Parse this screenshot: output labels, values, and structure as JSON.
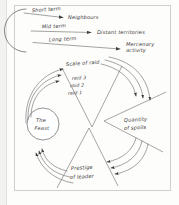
{
  "figure": {
    "title_visible": false,
    "background_color": "#fdfdfc",
    "ink_color": "#4a4a4a",
    "frame_color": "#cfcfcb"
  },
  "top_section": {
    "source_shape": "semicircle",
    "flows": [
      {
        "id": "short",
        "timescale": "Short term",
        "target": "Neighbours"
      },
      {
        "id": "mid",
        "timescale": "Mid term",
        "target": "Distant territories"
      },
      {
        "id": "long",
        "timescale": "Long term",
        "target_line1": "Mercenary",
        "target_line2": "activity"
      }
    ]
  },
  "cycle_section": {
    "center_node": {
      "line1": "The",
      "line2": "Feast"
    },
    "wedges": [
      {
        "id": "scale-of-raid",
        "position": "top",
        "label": "Scale of raid",
        "tiers": [
          "raid 3",
          "raid 2",
          "raid 1"
        ]
      },
      {
        "id": "quantity-of-spoils",
        "position": "right",
        "label_line1": "Quantity",
        "label_line2": "of spoils",
        "tiers": []
      },
      {
        "id": "prestige-of-leader",
        "position": "bottom",
        "label_line1": "Prestige",
        "label_line2": "of leader",
        "tiers": []
      }
    ],
    "arrow_groups": [
      {
        "id": "feast-to-scale",
        "from": "The Feast",
        "to": "Scale of raid",
        "count": 3,
        "direction": "up-right"
      },
      {
        "id": "scale-to-spoils",
        "from": "Scale of raid",
        "to": "Quantity of spoils",
        "count": 3,
        "direction": "down-right"
      },
      {
        "id": "spoils-to-prestige",
        "from": "Quantity of spoils",
        "to": "Prestige of leader",
        "count": 3,
        "direction": "down-left"
      },
      {
        "id": "prestige-to-feast",
        "from": "Prestige of leader",
        "to": "The Feast",
        "count": 3,
        "direction": "up-left"
      }
    ]
  }
}
